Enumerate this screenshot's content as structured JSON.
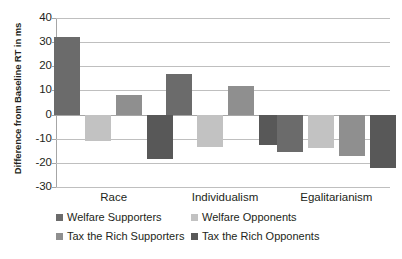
{
  "chart_data": {
    "type": "bar",
    "title": "",
    "subtitle": "",
    "xlabel": "",
    "ylabel": "Difference from Baseline RT in ms",
    "categories": [
      "Race",
      "Individualism",
      "Egalitarianism"
    ],
    "series": [
      {
        "name": "Welfare Supporters",
        "color": "#6b6b6b",
        "values": [
          32,
          17,
          -15.5
        ]
      },
      {
        "name": "Welfare Opponents",
        "color": "#c2c2c2",
        "values": [
          -11,
          -13.5,
          -14
        ]
      },
      {
        "name": "Tax the Rich Supporters",
        "color": "#8f8f8f",
        "values": [
          8,
          12,
          -17
        ]
      },
      {
        "name": "Tax the Rich Opponents",
        "color": "#585858",
        "values": [
          -18.5,
          -12.5,
          -22
        ]
      }
    ],
    "ylim": [
      -30,
      40
    ],
    "ytick_values": [
      40,
      30,
      20,
      10,
      0,
      -10,
      -20,
      -30
    ],
    "ytick_labels": [
      "40",
      "30",
      "20",
      "10",
      "0",
      "-10",
      "-20",
      "-30"
    ],
    "grid": true,
    "legend_position": "bottom"
  },
  "legend": {
    "entries": [
      {
        "label": "Welfare Supporters",
        "color": "#6b6b6b"
      },
      {
        "label": "Welfare Opponents",
        "color": "#c2c2c2"
      },
      {
        "label": "Tax the Rich Supporters",
        "color": "#8f8f8f"
      },
      {
        "label": "Tax the Rich Opponents",
        "color": "#585858"
      }
    ]
  }
}
